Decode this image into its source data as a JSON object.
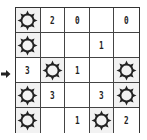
{
  "puzzle": {
    "rows": 5,
    "cols": 5,
    "cells": [
      [
        {
          "type": "sun"
        },
        {
          "type": "num",
          "value": "2"
        },
        {
          "type": "num",
          "value": "0"
        },
        {
          "type": "empty"
        },
        {
          "type": "num",
          "value": "0"
        }
      ],
      [
        {
          "type": "sun"
        },
        {
          "type": "empty"
        },
        {
          "type": "empty"
        },
        {
          "type": "num",
          "value": "1"
        },
        {
          "type": "empty"
        }
      ],
      [
        {
          "type": "num",
          "value": "3"
        },
        {
          "type": "sun"
        },
        {
          "type": "num",
          "value": "1"
        },
        {
          "type": "empty"
        },
        {
          "type": "sun"
        }
      ],
      [
        {
          "type": "sun"
        },
        {
          "type": "num",
          "value": "3"
        },
        {
          "type": "empty"
        },
        {
          "type": "num",
          "value": "3"
        },
        {
          "type": "sun"
        }
      ],
      [
        {
          "type": "sun"
        },
        {
          "type": "empty"
        },
        {
          "type": "num",
          "value": "1"
        },
        {
          "type": "sun"
        },
        {
          "type": "num",
          "value": "2"
        }
      ]
    ]
  },
  "row_pointer": {
    "row_index": 2,
    "icon": "arrow-right-icon"
  },
  "colors": {
    "grid_line": "#333333",
    "sun_cell_bg": "#f2f2f2",
    "icon": "#222222"
  }
}
